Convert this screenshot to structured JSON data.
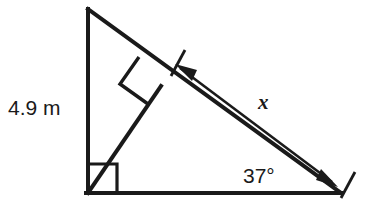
{
  "figure": {
    "type": "right-triangle-with-altitude",
    "background_color": "#ffffff",
    "stroke_color": "#1a1a1a",
    "labels": {
      "vertical_leg": "4.9 m",
      "hypotenuse_measure": "x",
      "base_angle": "37°"
    },
    "marks": {
      "right_angle_at_base_vertex": "right-angle-square",
      "right_angle_at_altitude_foot": "right-angle-square",
      "measure_arrow": "double-headed-arrow",
      "extension_ticks": 2
    },
    "geometry": {
      "apex": [
        88,
        9
      ],
      "base_left_vertex": [
        88,
        193
      ],
      "base_right_vertex": [
        341,
        193
      ],
      "altitude_foot": [
        160,
        85
      ],
      "arrow_start": [
        180,
        68
      ],
      "arrow_end": [
        334,
        184
      ]
    }
  }
}
